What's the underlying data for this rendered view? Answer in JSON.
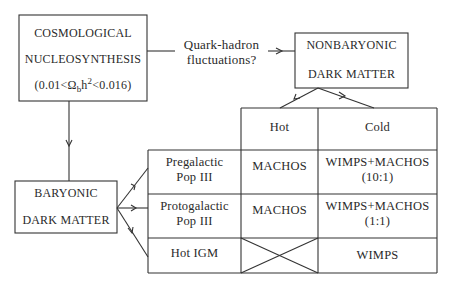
{
  "nodes": {
    "cosmological": {
      "line1": "COSMOLOGICAL",
      "line2": "NUCLEOSYNTHESIS",
      "range_open": "(0.01<",
      "omega": "Ω",
      "omega_sub": "b",
      "h": "h",
      "h_sup": "2",
      "range_close": "<0.016)"
    },
    "nonbaryonic": {
      "line1": "NONBARYONIC",
      "line2": "DARK MATTER"
    },
    "baryonic": {
      "line1": "BARYONIC",
      "line2": "DARK MATTER"
    }
  },
  "edge_label": {
    "line1": "Quark-hadron",
    "line2": "fluctuations?"
  },
  "table": {
    "columns": [
      "Hot",
      "Cold"
    ],
    "rows": [
      {
        "label_line1": "Pregalactic",
        "label_line2": "Pop III",
        "hot": "MACHOS",
        "cold_line1": "WIMPS+MACHOS",
        "cold_line2": "(10:1)"
      },
      {
        "label_line1": "Protogalactic",
        "label_line2": "Pop III",
        "hot": "MACHOS",
        "cold_line1": "WIMPS+MACHOS",
        "cold_line2": "(1:1)"
      },
      {
        "label_line1": "Hot IGM",
        "label_line2": "",
        "hot": "",
        "hot_crossed": true,
        "cold_line1": "WIMPS",
        "cold_line2": ""
      }
    ]
  }
}
